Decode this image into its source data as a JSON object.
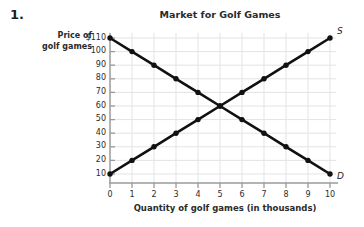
{
  "item_number": "1.",
  "chart_data": {
    "type": "line",
    "title": "Market for Golf Games",
    "xlabel": "Quantity of golf games (in thousands)",
    "ylabel": "Price of golf games",
    "ylabel_line1": "Price of",
    "ylabel_line2": "golf games",
    "grid": true,
    "legend_position": "curve-end-labels",
    "x": [
      0,
      1,
      2,
      3,
      4,
      5,
      6,
      7,
      8,
      9,
      10
    ],
    "xlim": [
      0,
      10
    ],
    "ylim": [
      0,
      110
    ],
    "xticks": [
      "0",
      "1",
      "2",
      "3",
      "4",
      "5",
      "6",
      "7",
      "8",
      "9",
      "10"
    ],
    "yticks": [
      "$110",
      "100",
      "90",
      "80",
      "70",
      "60",
      "50",
      "40",
      "30",
      "20",
      "10"
    ],
    "ytick_values": [
      110,
      100,
      90,
      80,
      70,
      60,
      50,
      40,
      30,
      20,
      10
    ],
    "series": [
      {
        "name": "Demand",
        "label": "D",
        "label_position": "bottom-right",
        "color": "#111111",
        "marker": "circle",
        "values": [
          110,
          100,
          90,
          80,
          70,
          60,
          50,
          40,
          30,
          20,
          10
        ]
      },
      {
        "name": "Supply",
        "label": "S",
        "label_position": "top-right",
        "color": "#111111",
        "marker": "circle",
        "values": [
          10,
          20,
          30,
          40,
          50,
          60,
          70,
          80,
          90,
          100,
          110
        ]
      }
    ],
    "equilibrium": {
      "quantity": 5,
      "price": 60
    },
    "axis_color": "#9a9a9a",
    "grid_color": "#e3e3e3",
    "text_color": "#2b2b2b"
  }
}
